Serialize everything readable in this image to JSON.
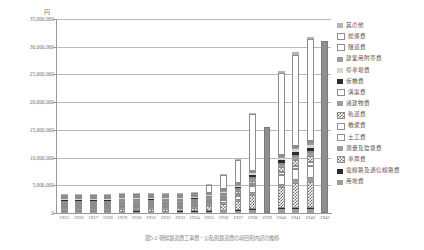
{
  "axis": {
    "unit_label": "円",
    "y_ticks": [
      "0",
      "5,000,000",
      "10,000,000",
      "15,000,000",
      "20,000,000",
      "25,000,000",
      "30,000,000",
      "35,000,000"
    ],
    "y_min": 0,
    "y_max": 35000000,
    "y_step": 5000000
  },
  "caption": "図5-2 朝鮮鉄道費工事費・公私別鉄道費の項目別内訳の推移",
  "legend": {
    "items": [
      {
        "label": "其の他",
        "pattern": "p-midgray"
      },
      {
        "label": "総係費",
        "pattern": "p-white"
      },
      {
        "label": "隧道費",
        "pattern": "p-white"
      },
      {
        "label": "建築用附帯費",
        "pattern": "p-gray"
      },
      {
        "label": "停車場費",
        "pattern": "p-ltgray"
      },
      {
        "label": "仮橋費",
        "pattern": "p-black"
      },
      {
        "label": "溝渠費",
        "pattern": "p-white"
      },
      {
        "label": "諸建物費",
        "pattern": "p-gray"
      },
      {
        "label": "軌道費",
        "pattern": "p-check"
      },
      {
        "label": "橋梁費",
        "pattern": "p-white"
      },
      {
        "label": "土工費",
        "pattern": "p-white"
      },
      {
        "label": "測量及監督費",
        "pattern": "p-gray"
      },
      {
        "label": "車両費",
        "pattern": "p-check"
      },
      {
        "label": "電線路及通信線路費",
        "pattern": "p-black"
      },
      {
        "label": "用地費",
        "pattern": "p-gray"
      }
    ]
  },
  "chart_data": {
    "type": "bar",
    "title": "",
    "xlabel": "",
    "ylabel": "円",
    "ylim": [
      0,
      35000000
    ],
    "grid": true,
    "legend_position": "right",
    "stacked": true,
    "categories": [
      "1925",
      "1926",
      "1927",
      "1928",
      "1929",
      "1930",
      "1931",
      "1932",
      "1933",
      "1934",
      "1935",
      "1936",
      "1937",
      "1938",
      "1939",
      "1940",
      "1941",
      "1942",
      "1943"
    ],
    "series": [
      {
        "name": "用地費",
        "pattern": "p-gray",
        "values": [
          60000,
          90000,
          110000,
          120000,
          160000,
          170000,
          160000,
          160000,
          170000,
          200000,
          260000,
          320000,
          420000,
          620000,
          0,
          700000,
          780000,
          800000,
          0
        ]
      },
      {
        "name": "電線路及通信線路費",
        "pattern": "p-black",
        "values": [
          10000,
          20000,
          20000,
          20000,
          30000,
          30000,
          30000,
          30000,
          30000,
          40000,
          50000,
          60000,
          80000,
          110000,
          0,
          130000,
          150000,
          160000,
          0
        ]
      },
      {
        "name": "車両費",
        "pattern": "p-check",
        "values": [
          180000,
          260000,
          330000,
          360000,
          520000,
          520000,
          500000,
          520000,
          540000,
          650000,
          880000,
          1150000,
          1600000,
          2500000,
          0,
          3800000,
          4400000,
          4700000,
          0
        ]
      },
      {
        "name": "測量及監督費",
        "pattern": "p-gray",
        "values": [
          30000,
          40000,
          60000,
          60000,
          80000,
          80000,
          80000,
          80000,
          90000,
          100000,
          140000,
          180000,
          240000,
          380000,
          0,
          500000,
          580000,
          620000,
          0
        ]
      },
      {
        "name": "土工費",
        "pattern": "p-white",
        "values": [
          90000,
          130000,
          160000,
          180000,
          250000,
          250000,
          240000,
          250000,
          260000,
          320000,
          430000,
          560000,
          780000,
          1200000,
          0,
          1700000,
          2000000,
          2200000,
          0
        ]
      },
      {
        "name": "橋梁費",
        "pattern": "p-white",
        "values": [
          30000,
          40000,
          50000,
          60000,
          80000,
          80000,
          80000,
          80000,
          85000,
          100000,
          140000,
          180000,
          250000,
          380000,
          0,
          520000,
          600000,
          650000,
          0
        ]
      },
      {
        "name": "軌道費",
        "pattern": "p-check",
        "values": [
          50000,
          70000,
          90000,
          100000,
          140000,
          140000,
          135000,
          140000,
          145000,
          180000,
          240000,
          310000,
          430000,
          680000,
          0,
          950000,
          1100000,
          1200000,
          0
        ]
      },
      {
        "name": "諸建物費",
        "pattern": "p-gray",
        "values": [
          20000,
          30000,
          40000,
          40000,
          60000,
          60000,
          55000,
          60000,
          62000,
          75000,
          100000,
          130000,
          180000,
          280000,
          0,
          400000,
          470000,
          500000,
          0
        ]
      },
      {
        "name": "溝渠費",
        "pattern": "p-white",
        "values": [
          15000,
          20000,
          25000,
          30000,
          40000,
          40000,
          38000,
          40000,
          42000,
          50000,
          68000,
          88000,
          120000,
          190000,
          0,
          270000,
          310000,
          340000,
          0
        ]
      },
      {
        "name": "仮橋費",
        "pattern": "p-black",
        "values": [
          20000,
          30000,
          40000,
          45000,
          60000,
          60000,
          58000,
          60000,
          63000,
          76000,
          100000,
          135000,
          190000,
          300000,
          0,
          430000,
          500000,
          540000,
          0
        ]
      },
      {
        "name": "停車場費",
        "pattern": "p-ltgray",
        "values": [
          25000,
          35000,
          45000,
          50000,
          70000,
          70000,
          68000,
          70000,
          73000,
          88000,
          120000,
          155000,
          215000,
          340000,
          0,
          480000,
          560000,
          600000,
          0
        ]
      },
      {
        "name": "建築用附帯費",
        "pattern": "p-gray",
        "values": [
          10000,
          15000,
          20000,
          22000,
          30000,
          30000,
          29000,
          30000,
          31000,
          38000,
          52000,
          67000,
          93000,
          147000,
          0,
          210000,
          245000,
          265000,
          0
        ]
      },
      {
        "name": "隧道費",
        "pattern": "p-white",
        "values": [
          15000,
          20000,
          28000,
          30000,
          42000,
          42000,
          40000,
          42000,
          44000,
          53000,
          72000,
          93000,
          130000,
          205000,
          0,
          290000,
          340000,
          370000,
          0
        ]
      },
      {
        "name": "総係費",
        "pattern": "p-white",
        "values": [
          40000,
          60000,
          80000,
          90000,
          120000,
          120000,
          118000,
          120000,
          125000,
          150000,
          1400000,
          2600000,
          4200000,
          10200000,
          0,
          14800000,
          16500000,
          18400000,
          0
        ]
      },
      {
        "name": "其の他",
        "pattern": "p-midgray",
        "values": [
          20000,
          30000,
          35000,
          40000,
          55000,
          55000,
          52000,
          55000,
          57000,
          70000,
          95000,
          125000,
          170000,
          270000,
          0,
          380000,
          440000,
          480000,
          0
        ]
      }
    ],
    "single_fill_years": [
      {
        "year": "1939",
        "total": 15600000,
        "pattern": "p-solidgray"
      },
      {
        "year": "1943",
        "total": 31000000,
        "pattern": "p-solidgray"
      }
    ],
    "totals": [
      615000,
      890000,
      1133000,
      1247000,
      1737000,
      1749000,
      1681000,
      1737000,
      1817000,
      2190000,
      4147000,
      6133000,
      9098000,
      17777000,
      15600000,
      25560000,
      28975000,
      31825000,
      31000000
    ]
  }
}
